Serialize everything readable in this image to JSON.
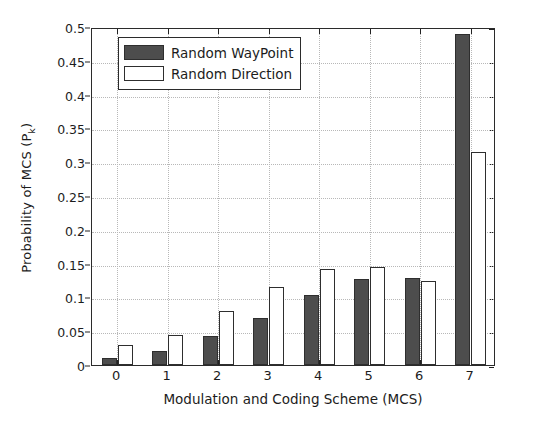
{
  "chart_data": {
    "type": "bar",
    "title": "",
    "xlabel": "Modulation and Coding Scheme (MCS)",
    "ylabel": "Probability of MCS (P",
    "ylabel_sub": "k",
    "ylabel_suffix": ")",
    "categories": [
      "0",
      "1",
      "2",
      "3",
      "4",
      "5",
      "6",
      "7"
    ],
    "ylim": [
      0,
      0.5
    ],
    "xlim": [
      -0.5,
      7.5
    ],
    "yticks": [
      "0",
      "0.05",
      "0.1",
      "0.15",
      "0.2",
      "0.25",
      "0.3",
      "0.35",
      "0.4",
      "0.45",
      "0.5"
    ],
    "ytick_values": [
      0,
      0.05,
      0.1,
      0.15,
      0.2,
      0.25,
      0.3,
      0.35,
      0.4,
      0.45,
      0.5
    ],
    "grid": "horizontal-and-vertical-dotted",
    "legend_position": "top-left-inside",
    "series": [
      {
        "name": "Random WayPoint",
        "color": "#4d4d4d",
        "edge_color": "#2e2e2e",
        "values": [
          0.011,
          0.02,
          0.043,
          0.07,
          0.103,
          0.127,
          0.129,
          0.49
        ]
      },
      {
        "name": "Random Direction",
        "color": "#ffffff",
        "edge_color": "#2e2e2e",
        "values": [
          0.029,
          0.044,
          0.08,
          0.115,
          0.142,
          0.145,
          0.124,
          0.315
        ]
      }
    ]
  },
  "figure": {
    "background": "#ffffff",
    "axes_color": "#2b2b2b",
    "grid_color": "#b8b8b8",
    "text_color": "#1c1c1c"
  }
}
